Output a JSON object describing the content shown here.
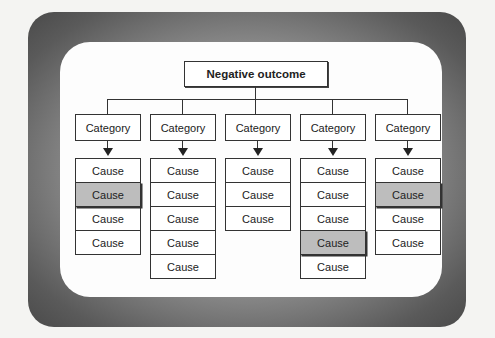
{
  "diagram": {
    "root": {
      "label": "Negative outcome"
    },
    "categories": [
      {
        "label": "Category",
        "causes": [
          {
            "label": "Cause",
            "highlighted": false
          },
          {
            "label": "Cause",
            "highlighted": true
          },
          {
            "label": "Cause",
            "highlighted": false
          },
          {
            "label": "Cause",
            "highlighted": false
          }
        ]
      },
      {
        "label": "Category",
        "causes": [
          {
            "label": "Cause",
            "highlighted": false
          },
          {
            "label": "Cause",
            "highlighted": false
          },
          {
            "label": "Cause",
            "highlighted": false
          },
          {
            "label": "Cause",
            "highlighted": false
          },
          {
            "label": "Cause",
            "highlighted": false
          }
        ]
      },
      {
        "label": "Category",
        "causes": [
          {
            "label": "Cause",
            "highlighted": false
          },
          {
            "label": "Cause",
            "highlighted": false
          },
          {
            "label": "Cause",
            "highlighted": false
          }
        ]
      },
      {
        "label": "Category",
        "causes": [
          {
            "label": "Cause",
            "highlighted": false
          },
          {
            "label": "Cause",
            "highlighted": false
          },
          {
            "label": "Cause",
            "highlighted": false
          },
          {
            "label": "Cause",
            "highlighted": true
          },
          {
            "label": "Cause",
            "highlighted": false
          }
        ]
      },
      {
        "label": "Category",
        "causes": [
          {
            "label": "Cause",
            "highlighted": false
          },
          {
            "label": "Cause",
            "highlighted": true
          },
          {
            "label": "Cause",
            "highlighted": false
          },
          {
            "label": "Cause",
            "highlighted": false
          }
        ]
      }
    ],
    "colors": {
      "highlight": "#bdbdbd",
      "line": "#333333",
      "frame": "#8a8a8a"
    }
  }
}
